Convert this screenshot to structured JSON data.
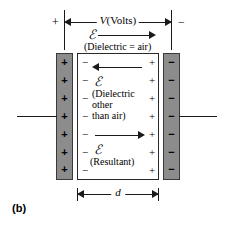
{
  "figure": {
    "label": "(b)",
    "title_symbol": "ℰ",
    "terminals": {
      "positive": "+",
      "negative": "−"
    },
    "voltage_dimension": {
      "label_italic": "V",
      "label_rest": "(Volts)",
      "full_label": "V(Volts)",
      "direction": "both"
    },
    "gap_dimension": {
      "label": "d",
      "direction": "both"
    },
    "left_plate": {
      "name": "positive-plate",
      "fill_color": "#8c8c8c",
      "charge_sign": "+",
      "charge_count": 7,
      "charges": [
        "+",
        "+",
        "+",
        "+",
        "+",
        "+",
        "+"
      ]
    },
    "right_plate": {
      "name": "negative-plate",
      "fill_color": "#8c8c8c",
      "charge_sign": "−",
      "charge_count": 7,
      "charges": [
        "−",
        "−",
        "−",
        "−",
        "−",
        "−",
        "−"
      ]
    },
    "dielectric_bound_charges": {
      "left_sign": "−",
      "right_sign": "+",
      "count": 7,
      "left": [
        "−",
        "−",
        "−",
        "−",
        "−",
        "−",
        "−"
      ],
      "right": [
        "+",
        "+",
        "+",
        "+",
        "+",
        "+",
        "+"
      ]
    },
    "fields": [
      {
        "id": "field-air",
        "symbol": "ℰ",
        "caption": "(Dielectric  =  air)",
        "arrow_direction": "right"
      },
      {
        "id": "field-dielectric",
        "symbol": "ℰ",
        "caption_line1": "(Dielectric",
        "caption_line2": "other",
        "caption_line3": "than air)",
        "arrow_direction": "left"
      },
      {
        "id": "field-resultant",
        "symbol": "ℰ",
        "caption": "(Resultant)",
        "arrow_direction": "right"
      }
    ],
    "colors": {
      "plate_fill": "#8c8c8c",
      "plate_stroke": "#3a3a3a",
      "line": "#1a1a1a",
      "background": "#ffffff"
    }
  }
}
